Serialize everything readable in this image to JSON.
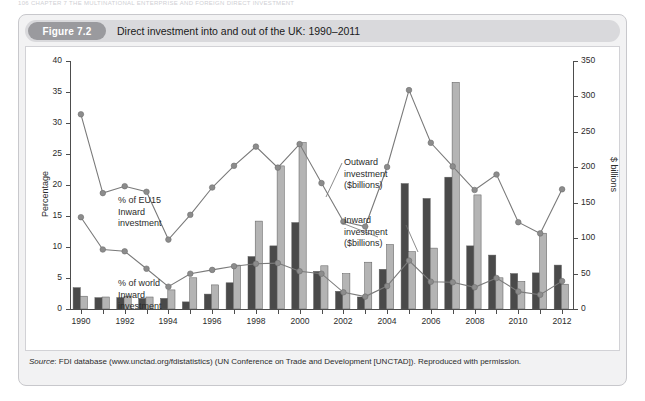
{
  "running_head": "106  CHAPTER 7  THE MULTINATIONAL ENTERPRISE AND FOREIGN DIRECT INVESTMENT",
  "figure": {
    "badge": "Figure 7.2",
    "title": "Direct investment into and out of the UK: 1990–2011",
    "source_prefix": "Source",
    "source_text": ": FDI database (www.unctad.org/fdistatistics) (UN Conference on Trade and Development [UNCTAD]). Reproduced with permission."
  },
  "colors": {
    "inward_bar": "#4a4a4a",
    "outward_bar": "#b4b4b4",
    "line": "#7a7a7a",
    "marker": "#8c8c8c",
    "axis": "#4d4d4d",
    "panel": "#f2f2f3",
    "badge": "#9a9a9e",
    "header": "#d9d9dc"
  },
  "annotations": [
    {
      "id": "eu15-label",
      "text": "% of EU15\nInward\ninvestment",
      "x": 92,
      "y": 148
    },
    {
      "id": "world-label",
      "text": "% of world\nInward\ninvestment",
      "x": 92,
      "y": 231
    },
    {
      "id": "outward-label",
      "text": "Outward\ninvestment\n($billions)",
      "x": 318,
      "y": 110
    },
    {
      "id": "inward-label",
      "text": "Inward\ninvestment\n($billions)",
      "x": 318,
      "y": 168
    }
  ],
  "chart_data": {
    "type": "bar",
    "title": "Direct investment into and out of the UK: 1990–2011",
    "xlabel": "",
    "ylabel": "Percentage",
    "y2label": "$ billions",
    "ylim": [
      0,
      40
    ],
    "y2lim": [
      0,
      350
    ],
    "yticks": [
      0,
      5,
      10,
      15,
      20,
      25,
      30,
      35,
      40
    ],
    "y2ticks": [
      0,
      50,
      100,
      150,
      200,
      250,
      300,
      350
    ],
    "grid": false,
    "legend": "annotations-inline",
    "x": [
      1990,
      1991,
      1992,
      1993,
      1994,
      1995,
      1996,
      1997,
      1998,
      1999,
      2000,
      2001,
      2002,
      2003,
      2004,
      2005,
      2006,
      2007,
      2008,
      2009,
      2010,
      2011,
      2012
    ],
    "xtick_labels": [
      "1990",
      "",
      "1992",
      "",
      "1994",
      "",
      "1996",
      "",
      "1998",
      "",
      "2000",
      "",
      "2002",
      "",
      "2004",
      "",
      "2006",
      "",
      "2008",
      "",
      "2010",
      "",
      "2012"
    ],
    "series": [
      {
        "name": "Inward investment ($billions)",
        "axis": "right",
        "kind": "bar",
        "color": "#4a4a4a",
        "values": [
          30,
          16,
          16,
          15,
          15,
          10,
          21,
          37,
          74,
          89,
          122,
          53,
          25,
          17,
          56,
          177,
          156,
          186,
          89,
          76,
          50,
          51,
          62
        ]
      },
      {
        "name": "Outward investment ($billions)",
        "axis": "right",
        "kind": "bar",
        "color": "#b4b4b4",
        "values": [
          18,
          17,
          18,
          17,
          27,
          44,
          34,
          62,
          124,
          202,
          235,
          61,
          50,
          66,
          91,
          81,
          86,
          320,
          161,
          44,
          39,
          107,
          35
        ]
      },
      {
        "name": "% of EU15 Inward investment",
        "axis": "left",
        "kind": "line",
        "color": "#7a7a7a",
        "values": [
          31.4,
          18.7,
          19.8,
          18.9,
          11.2,
          15.2,
          19.6,
          23.1,
          26.2,
          22.8,
          26.6,
          20.3,
          14.1,
          13.3,
          22.9,
          35.3,
          26.8,
          23.0,
          19.2,
          21.7,
          14.0,
          12.2,
          19.3
        ]
      },
      {
        "name": "% of world Inward investment",
        "axis": "left",
        "kind": "line",
        "color": "#7a7a7a",
        "values": [
          14.8,
          9.6,
          9.3,
          6.5,
          3.6,
          5.7,
          6.3,
          6.9,
          7.3,
          7.4,
          6.1,
          5.7,
          2.7,
          2.0,
          3.7,
          7.8,
          4.4,
          4.3,
          3.5,
          5.0,
          2.8,
          2.3,
          4.5
        ]
      }
    ]
  }
}
